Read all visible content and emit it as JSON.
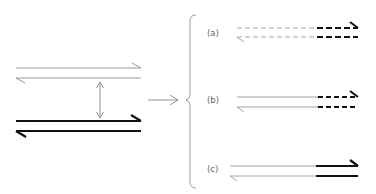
{
  "diagram": {
    "type": "strand-exchange schematic",
    "colors": {
      "thin_strand": "#9a9a9a",
      "thick_strand": "#111111",
      "arrow": "#888888",
      "brace": "#999999",
      "label": "#666666"
    },
    "left": {
      "upper_duplex": {
        "style": "thin",
        "description": "thin antiparallel pair"
      },
      "lower_duplex": {
        "style": "thick",
        "description": "thick antiparallel pair"
      },
      "pairing_arrow": "double-headed vertical arrow"
    },
    "transition_arrow": "right arrow to brace",
    "variants": [
      {
        "label": "(a)",
        "style": "dashed thin strands with dashed thick segment at right end"
      },
      {
        "label": "(b)",
        "style": "solid thin strands with dashed thick segment at right end"
      },
      {
        "label": "(c)",
        "style": "solid thin strands with solid thick segment at right end"
      }
    ]
  }
}
